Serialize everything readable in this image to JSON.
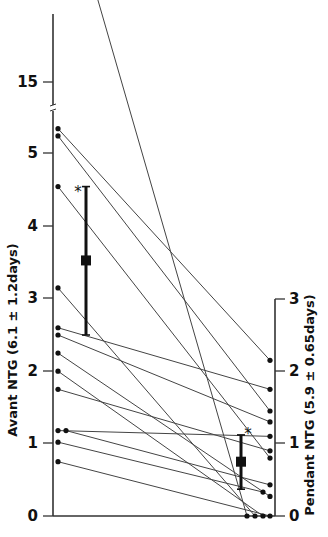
{
  "chart_data": {
    "type": "scatter",
    "subtype": "paired-before-after",
    "title": "",
    "left_axis": {
      "label": "Avant NTG (6.1 ± 1.2days)",
      "ticks": [
        "0",
        "1",
        "2",
        "3",
        "4",
        "5",
        "15"
      ],
      "range": [
        0,
        19
      ],
      "axis_break_between": [
        5.5,
        14
      ]
    },
    "right_axis": {
      "label": "Pendant NTG (5.9 ± 0.65days)",
      "ticks": [
        "0",
        "1",
        "2",
        "3"
      ],
      "range": [
        0,
        3
      ]
    },
    "pairs": [
      {
        "before": 18.8,
        "during": 0.0
      },
      {
        "before": 5.35,
        "during": 2.15
      },
      {
        "before": 5.25,
        "during": 1.45
      },
      {
        "before": 4.55,
        "during": 0.8
      },
      {
        "before": 3.15,
        "during": 0.0
      },
      {
        "before": 2.6,
        "during": 1.75
      },
      {
        "before": 2.5,
        "during": 1.3
      },
      {
        "before": 2.25,
        "during": 0.27
      },
      {
        "before": 2.0,
        "during": 0.0
      },
      {
        "before": 1.75,
        "during": 0.9
      },
      {
        "before": 1.18,
        "during": 1.1
      },
      {
        "before": 1.18,
        "during": 0.43
      },
      {
        "before": 1.02,
        "during": 0.33
      },
      {
        "before": 0.75,
        "during": 0.0
      }
    ],
    "summary": {
      "before": {
        "mean": 3.53,
        "sd_low": 2.5,
        "sd_high": 4.55,
        "marker": "*"
      },
      "during": {
        "mean": 0.75,
        "sd_low": 0.37,
        "sd_high": 1.12,
        "marker": "*"
      }
    },
    "grid": false,
    "legend": null
  },
  "labels": {
    "left_axis_label": "Avant NTG (6.1 ± 1.2days)",
    "right_axis_label": "Pendant NTG (5.9 ± 0.65days)",
    "significance_marker": "*"
  }
}
